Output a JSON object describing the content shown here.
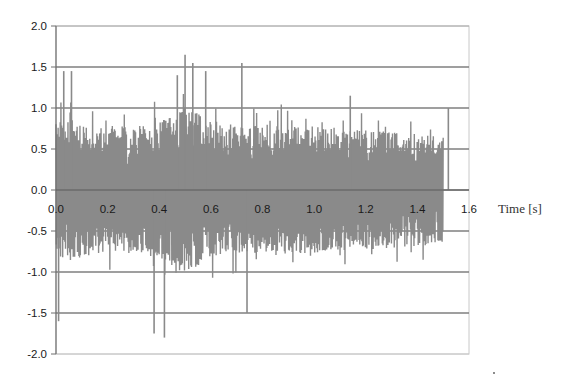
{
  "chart_data": {
    "type": "line",
    "title": "",
    "xlabel": "Time [s]",
    "ylabel": "",
    "xlim": [
      0.0,
      1.6
    ],
    "ylim": [
      -2.0,
      2.0
    ],
    "x_ticks": [
      "0.0",
      "0.2",
      "0.4",
      "0.6",
      "0.8",
      "1.0",
      "1.2",
      "1.4",
      "1.6"
    ],
    "y_ticks": [
      "2.0",
      "1.5",
      "1.0",
      "0.5",
      "0.0",
      "-0.5",
      "-1.0",
      "-1.5",
      "-2.0"
    ],
    "grid": {
      "horizontal": true,
      "vertical": false
    },
    "legend": null,
    "series": [
      {
        "name": "signal",
        "description": "Dense random vibration/noise signal sampled from t=0.0 to t=1.5 s, approximately zero-mean with amplitude mostly within ±1.0 and peaks reaching about +1.65 (near t≈0.5 s) and -1.8 (near t≈0.37 s)",
        "t_start": 0.0,
        "t_end": 1.5,
        "max_value": 1.65,
        "min_value": -1.8,
        "typical_envelope": 1.0,
        "color": "#8a8a8a"
      }
    ],
    "notable_peaks": [
      {
        "t": 0.01,
        "value": -1.6
      },
      {
        "t": 0.03,
        "value": 1.45
      },
      {
        "t": 0.06,
        "value": 1.45
      },
      {
        "t": 0.38,
        "value": -1.75
      },
      {
        "t": 0.42,
        "value": -1.8
      },
      {
        "t": 0.47,
        "value": 1.4
      },
      {
        "t": 0.5,
        "value": 1.65
      },
      {
        "t": 0.53,
        "value": 1.55
      },
      {
        "t": 0.58,
        "value": 1.45
      },
      {
        "t": 0.72,
        "value": 1.55
      },
      {
        "t": 0.74,
        "value": -1.5
      },
      {
        "t": 1.14,
        "value": 1.15
      },
      {
        "t": 1.52,
        "value": 1.0
      }
    ]
  },
  "axis": {
    "x_title": "Time [s]",
    "cut_off_ylabel_fragment": "]"
  },
  "colors": {
    "signal": "#8a8a8a",
    "gridline": "#7f7f7f",
    "axis": "#7f7f7f",
    "background": "#ffffff"
  }
}
